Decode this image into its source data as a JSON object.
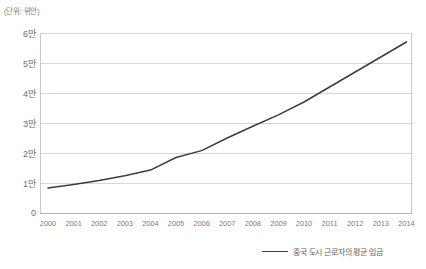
{
  "unit_note": "(단위: 위안)",
  "legend": {
    "series_label": "중국 도시 근로자의 평균 임금",
    "line_color": "#3d3d3d"
  },
  "axis": {
    "y_ticks": [
      "0",
      "1만",
      "2만",
      "3만",
      "4만",
      "5만",
      "6만"
    ],
    "x_ticks": [
      "2000",
      "2001",
      "2002",
      "2003",
      "2004",
      "2005",
      "2006",
      "2007",
      "2008",
      "2009",
      "2010",
      "2011",
      "2012",
      "2013",
      "2014"
    ]
  },
  "chart_data": {
    "type": "line",
    "title": "",
    "subtitle": "",
    "xlabel": "",
    "ylabel": "(단위: 위안)",
    "grid": true,
    "legend_position": "bottom-right",
    "categories": [
      "2000",
      "2001",
      "2002",
      "2003",
      "2004",
      "2005",
      "2006",
      "2007",
      "2008",
      "2009",
      "2010",
      "2011",
      "2012",
      "2013",
      "2014"
    ],
    "ylim": [
      0,
      60000
    ],
    "ytick_values": [
      0,
      10000,
      20000,
      30000,
      40000,
      50000,
      60000
    ],
    "ytick_labels": [
      "0",
      "1만",
      "2만",
      "3만",
      "4만",
      "5만",
      "6만"
    ],
    "series": [
      {
        "name": "중국 도시 근로자의 평균 임금",
        "color": "#3d3d3d",
        "values": [
          8300,
          9500,
          10800,
          12400,
          14300,
          18500,
          20800,
          25000,
          28900,
          32700,
          37000,
          42000,
          47000,
          52000,
          57000
        ]
      }
    ]
  }
}
